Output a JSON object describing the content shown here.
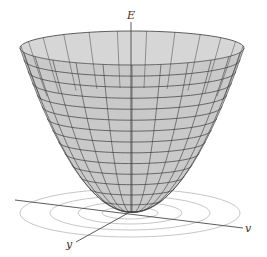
{
  "figure": {
    "type": "3d-surface-plot",
    "surface": "paraboloid",
    "colors": {
      "surface_fill": "#c9c9c9",
      "surface_inner": "#d6d6d6",
      "mesh_line": "#3a3a3a",
      "axis_line": "#4a4a4a",
      "contour_line": "#b8b8b8",
      "label": "#333333"
    },
    "axes": {
      "vertical": {
        "label": "E"
      },
      "horizontal": {
        "label": "v"
      },
      "depth": {
        "label": "y"
      }
    },
    "contours": {
      "count": 4
    }
  },
  "chart_data": {
    "type": "surface",
    "title": "",
    "surface": "E = v^2 + y^2 (paraboloid)",
    "axes_labels": {
      "z": "E",
      "x": "v",
      "y": "y"
    },
    "contour_levels_in_base_plane": 4,
    "mesh": {
      "radial_lines": 24,
      "level_rings": 14
    },
    "grid": false,
    "legend": null
  }
}
